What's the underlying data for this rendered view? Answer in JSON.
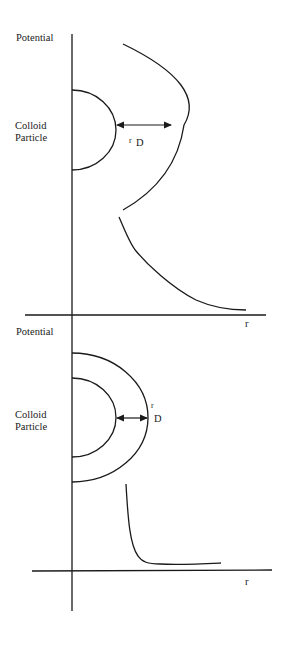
{
  "diagram": {
    "stroke_color": "#1a1a1a",
    "panels": [
      {
        "id": "top",
        "y_axis_label": "Potential",
        "particle_label_line1": "Colloid",
        "particle_label_line2": "Particle",
        "debye_label_r": "r",
        "debye_label_d": "D",
        "x_axis_label": "r",
        "description": "Thick double layer: potential decays slowly with distance r"
      },
      {
        "id": "bottom",
        "y_axis_label": "Potential",
        "particle_label_line1": "Colloid",
        "particle_label_line2": "Particle",
        "debye_label_r": "r",
        "debye_label_d": "D",
        "x_axis_label": "r",
        "description": "Thin double layer: potential decays rapidly with distance r"
      }
    ]
  }
}
